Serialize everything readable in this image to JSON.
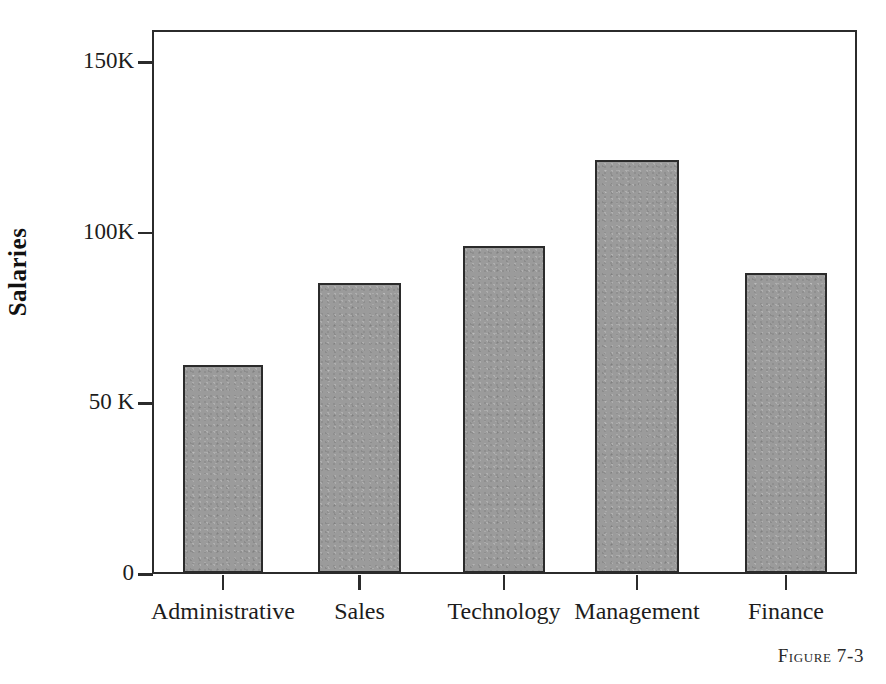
{
  "figure": {
    "caption": "Figure 7-3"
  },
  "chart_data": {
    "type": "bar",
    "title": "",
    "xlabel": "",
    "ylabel": "Salaries",
    "categories": [
      "Administrative",
      "Sales",
      "Technology",
      "Management",
      "Finance"
    ],
    "values": [
      61000,
      85000,
      96000,
      121000,
      88000
    ],
    "ylim": [
      0,
      160000
    ],
    "y_ticks": [
      0,
      50000,
      100000,
      150000
    ],
    "y_tick_labels": [
      "0",
      "50 K",
      "100K",
      "150K"
    ],
    "grid": false,
    "legend": null,
    "bar_fill_color": "#9b9b9b",
    "bar_border_color": "#2b2b2b",
    "axis_color": "#2b2b2b",
    "background_color": "#ffffff"
  }
}
